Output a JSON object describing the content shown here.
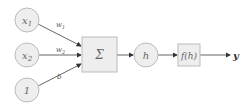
{
  "diagram": {
    "type": "perceptron",
    "inputs": [
      {
        "label": "x",
        "sub": "1",
        "weight": "w",
        "weight_sub": "1"
      },
      {
        "label": "x",
        "sub": "2",
        "weight": "w",
        "weight_sub": "2"
      },
      {
        "label": "1",
        "sub": "",
        "weight": "b",
        "weight_sub": ""
      }
    ],
    "sum_node": {
      "label": "Σ"
    },
    "hidden_node": {
      "label": "h"
    },
    "activation_node": {
      "label": "f(h)"
    },
    "output": {
      "label": "y"
    },
    "colors": {
      "node_fill": "#eeeeee",
      "node_stroke": "#bbbbbb",
      "edge": "#555555"
    }
  }
}
